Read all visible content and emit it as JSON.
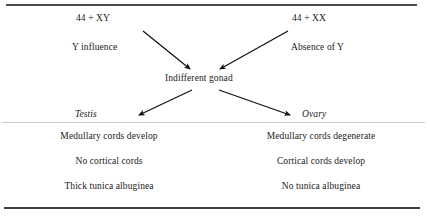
{
  "figure": {
    "rules": {
      "top_color": "#4a4a52",
      "middle_color": "#c9c9cd",
      "bottom_color": "#3d3d43"
    }
  },
  "flow": {
    "karyotype_male": "44 + XY",
    "karyotype_female": "44 + XX",
    "factor_male": "Y influence",
    "factor_female": "Absence of Y",
    "intermediate": "Indifferent gonad",
    "outcome_male": "Testis",
    "outcome_female": "Ovary"
  },
  "arrows": [
    {
      "name": "arrow-xy-to-gonad",
      "from_x": 143,
      "from_y": 31,
      "to_x": 190,
      "to_y": 69
    },
    {
      "name": "arrow-xx-to-gonad",
      "from_x": 288,
      "from_y": 31,
      "to_x": 220,
      "to_y": 69
    },
    {
      "name": "arrow-gonad-to-testis",
      "from_x": 192,
      "from_y": 90,
      "to_x": 139,
      "to_y": 115
    },
    {
      "name": "arrow-gonad-to-ovary",
      "from_x": 219,
      "from_y": 90,
      "to_x": 290,
      "to_y": 115
    }
  ],
  "outcomes": {
    "testis": [
      "Medullary cords develop",
      "No cortical cords",
      "Thick tunica albuginea"
    ],
    "ovary": [
      "Medullary cords degenerate",
      "Cortical cords develop",
      "No tunica albuginea"
    ]
  }
}
